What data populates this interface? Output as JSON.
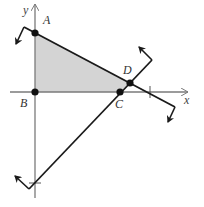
{
  "diagram": {
    "type": "coordinate-geometry",
    "axes": {
      "x_label": "x",
      "y_label": "y",
      "color": "#7a7a7a"
    },
    "points": [
      {
        "label": "A",
        "x": 35,
        "y": 33,
        "label_x": 43,
        "label_y": 24
      },
      {
        "label": "B",
        "x": 35,
        "y": 92,
        "label_x": 21,
        "label_y": 107
      },
      {
        "label": "C",
        "x": 120,
        "y": 92,
        "label_x": 116,
        "label_y": 108
      },
      {
        "label": "D",
        "x": 130,
        "y": 83,
        "label_x": 124,
        "label_y": 73
      }
    ],
    "shaded_region": {
      "vertices": [
        "A",
        "B",
        "C",
        "D"
      ],
      "fill": "#d4d4d4"
    },
    "line_color": "#1a1a1a",
    "point_color": "#111111",
    "label_color": "#333333"
  }
}
